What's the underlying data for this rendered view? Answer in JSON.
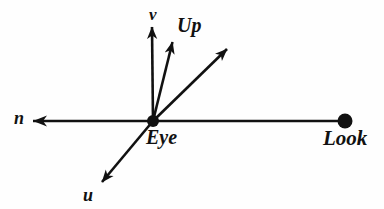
{
  "diagram": {
    "background_color": "#fefefe",
    "stroke_color": "#111111",
    "canvas": {
      "width": 384,
      "height": 209
    },
    "origin": {
      "name": "Eye",
      "x": 153,
      "y": 121,
      "dot_radius": 6
    },
    "labels": {
      "v": "v",
      "up": "Up",
      "n": "n",
      "eye": "Eye",
      "look": "Look",
      "u": "u"
    },
    "points": [
      {
        "name": "Look",
        "x": 345,
        "y": 121,
        "dot_radius": 7,
        "label": "Look"
      },
      {
        "name": "Eye",
        "x": 153,
        "y": 121,
        "dot_radius": 6,
        "label": "Eye"
      }
    ],
    "vectors": [
      {
        "name": "v-axis",
        "label": "v",
        "from": {
          "x": 153,
          "y": 121
        },
        "to": {
          "x": 152,
          "y": 25
        },
        "arrowhead": true,
        "description": "near-vertical axis pointing up"
      },
      {
        "name": "up-vector",
        "label": "Up",
        "from": {
          "x": 153,
          "y": 121
        },
        "to": {
          "x": 173,
          "y": 40
        },
        "arrowhead": true,
        "description": "world up vector tilted right of v"
      },
      {
        "name": "unlabeled-diagonal",
        "label": "",
        "from": {
          "x": 153,
          "y": 121
        },
        "to": {
          "x": 229,
          "y": 47
        },
        "arrowhead": true,
        "description": "diagonal arrow toward upper right"
      },
      {
        "name": "n-axis",
        "label": "n",
        "from": {
          "x": 345,
          "y": 121
        },
        "to": {
          "x": 31,
          "y": 121
        },
        "arrowhead": true,
        "description": "horizontal axis pointing left from Look through Eye"
      },
      {
        "name": "u-axis",
        "label": "u",
        "from": {
          "x": 153,
          "y": 121
        },
        "to": {
          "x": 100,
          "y": 184
        },
        "arrowhead": true,
        "description": "axis pointing down-left"
      }
    ]
  }
}
